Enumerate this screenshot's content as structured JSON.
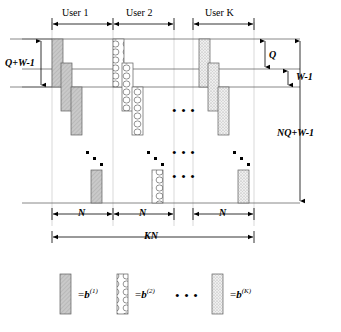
{
  "figure": {
    "kind": "block-staircase-diagram",
    "user_labels": [
      {
        "text": "User 1",
        "x": 62,
        "y": 16
      },
      {
        "text": "User 2",
        "x": 126,
        "y": 16
      },
      {
        "text": "User K",
        "x": 215,
        "y": 16
      }
    ],
    "dimension_labels": {
      "left_total": "Q+W-1",
      "right_q": "Q",
      "right_w": "W-1",
      "right_total": "NQ+W-1",
      "segment": "N",
      "overall": "KN"
    },
    "bottom_segments": [
      {
        "text": "N",
        "x": 63
      },
      {
        "text": "N",
        "x": 126
      },
      {
        "text": "N",
        "x": 222
      }
    ],
    "ellipsis": {
      "glyph": "• • •",
      "groups": [
        {
          "x": 178,
          "y": 110
        },
        {
          "x": 178,
          "y": 152
        },
        {
          "x": 178,
          "y": 176
        }
      ]
    },
    "legend": {
      "equals": "=",
      "items": [
        {
          "id": "b1",
          "symbol": "b",
          "superscript": "(1)",
          "pattern": "solid-gray-hatch"
        },
        {
          "id": "b2",
          "symbol": "b",
          "superscript": "(2)",
          "pattern": "oval-chain"
        },
        {
          "id": "bK",
          "symbol": "b",
          "superscript": "(K)",
          "pattern": "light-stipple"
        }
      ],
      "separator": "• • •"
    },
    "colors": {
      "line": "#000000",
      "rule": "#555555",
      "guide": "#bbbbbb",
      "fill_solid": "#c9c9c9",
      "fill_light": "#ededed",
      "fill_white": "#ffffff",
      "stroke_block": "#555555"
    },
    "blocks": {
      "user1": [
        {
          "x": 52,
          "y": 39,
          "w": 11,
          "h": 48
        },
        {
          "x": 61,
          "y": 63,
          "w": 11,
          "h": 48
        },
        {
          "x": 71,
          "y": 87,
          "w": 11,
          "h": 48
        },
        {
          "x": 91,
          "y": 170,
          "w": 11,
          "h": 33
        }
      ],
      "user2": [
        {
          "x": 113,
          "y": 39,
          "w": 11,
          "h": 48
        },
        {
          "x": 122,
          "y": 63,
          "w": 11,
          "h": 48
        },
        {
          "x": 132,
          "y": 87,
          "w": 11,
          "h": 48
        },
        {
          "x": 152,
          "y": 170,
          "w": 11,
          "h": 33
        }
      ],
      "userk": [
        {
          "x": 199,
          "y": 39,
          "w": 11,
          "h": 48
        },
        {
          "x": 208,
          "y": 63,
          "w": 11,
          "h": 48
        },
        {
          "x": 218,
          "y": 87,
          "w": 11,
          "h": 48
        },
        {
          "x": 238,
          "y": 170,
          "w": 11,
          "h": 33
        }
      ]
    },
    "dot_runs": [
      {
        "dots": [
          [
            86,
            151
          ],
          [
            93,
            157
          ],
          [
            100,
            163
          ]
        ]
      },
      {
        "dots": [
          [
            147,
            151
          ],
          [
            154,
            157
          ],
          [
            161,
            163
          ]
        ]
      },
      {
        "dots": [
          [
            233,
            151
          ],
          [
            240,
            157
          ],
          [
            247,
            163
          ]
        ]
      }
    ],
    "reference_lines_y": [
      39,
      69,
      87,
      203
    ],
    "user_column_bounds": {
      "u1": [
        52,
        113
      ],
      "u2": [
        113,
        174
      ],
      "uk": [
        193,
        254
      ]
    }
  }
}
